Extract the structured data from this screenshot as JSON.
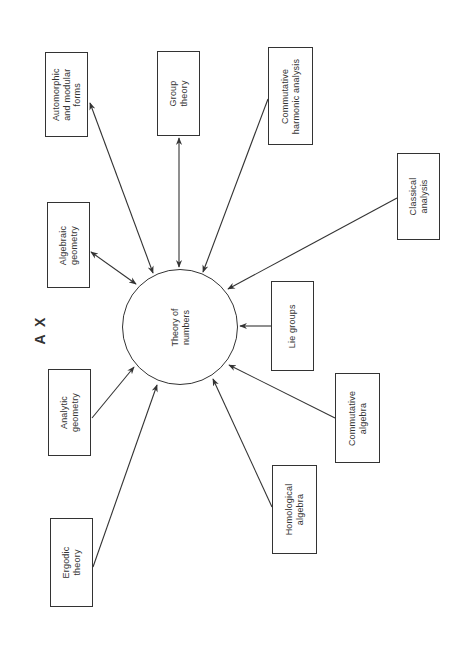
{
  "figure_label": "A X",
  "hub": {
    "label": "Theory of\nnumbers",
    "cx": 180,
    "cy": 327,
    "r": 58
  },
  "nodes": [
    {
      "id": "automorphic",
      "label": "Automorphic\nand modular\nforms",
      "x": 45,
      "y": 52,
      "w": 43,
      "h": 85,
      "direction": "bidirectional"
    },
    {
      "id": "group-theory",
      "label": "Group\ntheory",
      "x": 157,
      "y": 51,
      "w": 43,
      "h": 85,
      "direction": "bidirectional"
    },
    {
      "id": "commutative-harmonic-analysis",
      "label": "Commutative\nharmonic analysis",
      "x": 268,
      "y": 47,
      "w": 45,
      "h": 98,
      "direction": "to-hub"
    },
    {
      "id": "classical-analysis",
      "label": "Classical\nanalysis",
      "x": 397,
      "y": 153,
      "w": 43,
      "h": 87,
      "direction": "to-hub"
    },
    {
      "id": "algebraic-geometry",
      "label": "Algebraic\ngeometry",
      "x": 47,
      "y": 202,
      "w": 43,
      "h": 86,
      "direction": "bidirectional"
    },
    {
      "id": "lie-groups",
      "label": "Lie groups",
      "x": 271,
      "y": 281,
      "w": 43,
      "h": 90,
      "direction": "to-hub"
    },
    {
      "id": "analytic-geometry",
      "label": "Analytic\ngeometry",
      "x": 48,
      "y": 369,
      "w": 43,
      "h": 87,
      "direction": "to-hub"
    },
    {
      "id": "commutative-algebra",
      "label": "Commutative\nalgebra",
      "x": 335,
      "y": 373,
      "w": 45,
      "h": 90,
      "direction": "to-hub"
    },
    {
      "id": "homological-algebra",
      "label": "Homological\nalgebra",
      "x": 272,
      "y": 465,
      "w": 45,
      "h": 89,
      "direction": "to-hub"
    },
    {
      "id": "ergodic-theory",
      "label": "Ergodic\ntheory",
      "x": 50,
      "y": 518,
      "w": 43,
      "h": 89,
      "direction": "to-hub"
    }
  ],
  "edges": [
    {
      "from": "automorphic",
      "x1": 90,
      "y1": 103,
      "x2": 153,
      "y2": 273,
      "arrow_start": true,
      "arrow_end": true
    },
    {
      "from": "group-theory",
      "x1": 179,
      "y1": 138,
      "x2": 179,
      "y2": 267,
      "arrow_start": true,
      "arrow_end": true
    },
    {
      "from": "commutative-harmonic-analysis",
      "x1": 268,
      "y1": 99,
      "x2": 203,
      "y2": 272,
      "arrow_start": false,
      "arrow_end": true
    },
    {
      "from": "classical-analysis",
      "x1": 397,
      "y1": 198,
      "x2": 228,
      "y2": 289,
      "arrow_start": false,
      "arrow_end": true
    },
    {
      "from": "algebraic-geometry",
      "x1": 91,
      "y1": 252,
      "x2": 136,
      "y2": 284,
      "arrow_start": true,
      "arrow_end": true
    },
    {
      "from": "lie-groups",
      "x1": 271,
      "y1": 326,
      "x2": 240,
      "y2": 326,
      "arrow_start": false,
      "arrow_end": true
    },
    {
      "from": "analytic-geometry",
      "x1": 92,
      "y1": 418,
      "x2": 134,
      "y2": 367,
      "arrow_start": false,
      "arrow_end": true
    },
    {
      "from": "commutative-algebra",
      "x1": 335,
      "y1": 418,
      "x2": 229,
      "y2": 365,
      "arrow_start": false,
      "arrow_end": true
    },
    {
      "from": "homological-algebra",
      "x1": 272,
      "y1": 507,
      "x2": 213,
      "y2": 379,
      "arrow_start": false,
      "arrow_end": true
    },
    {
      "from": "ergodic-theory",
      "x1": 93,
      "y1": 567,
      "x2": 157,
      "y2": 385,
      "arrow_start": false,
      "arrow_end": true
    }
  ],
  "colors": {
    "stroke": "#333333",
    "text": "#333333",
    "background": "#ffffff"
  }
}
